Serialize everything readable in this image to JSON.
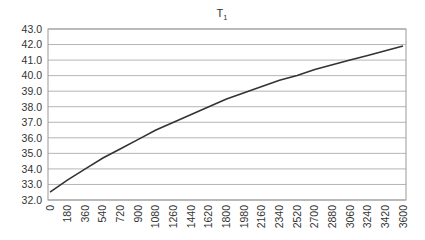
{
  "chart_data": {
    "type": "line",
    "title": "T",
    "title_subscript": "1",
    "xlabel": "",
    "ylabel": "",
    "ylim": [
      32.0,
      43.0
    ],
    "xlim": [
      0,
      3600
    ],
    "grid": true,
    "legend": "none",
    "y_ticks": [
      "32.0",
      "33.0",
      "34.0",
      "35.0",
      "36.0",
      "37.0",
      "38.0",
      "39.0",
      "40.0",
      "41.0",
      "42.0",
      "43.0"
    ],
    "x_ticks": [
      "0",
      "180",
      "360",
      "540",
      "720",
      "900",
      "1080",
      "1260",
      "1440",
      "1620",
      "1800",
      "1980",
      "2160",
      "2340",
      "2520",
      "2700",
      "2880",
      "3060",
      "3240",
      "3420",
      "3600"
    ],
    "series": [
      {
        "name": "T1",
        "x": [
          0,
          180,
          360,
          540,
          720,
          900,
          1080,
          1260,
          1440,
          1620,
          1800,
          1980,
          2160,
          2340,
          2520,
          2700,
          2880,
          3060,
          3240,
          3420,
          3600
        ],
        "values": [
          32.5,
          33.3,
          34.0,
          34.7,
          35.3,
          35.9,
          36.5,
          37.0,
          37.5,
          38.0,
          38.5,
          38.9,
          39.3,
          39.7,
          40.0,
          40.4,
          40.7,
          41.0,
          41.3,
          41.6,
          41.9
        ]
      }
    ],
    "line_color": "#333333",
    "grid_color": "#b5b5b5"
  }
}
